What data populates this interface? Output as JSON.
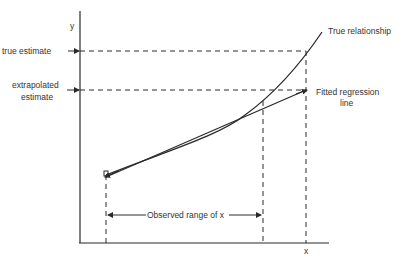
{
  "diagram": {
    "type": "regression-extrapolation",
    "labels": {
      "y_axis": "y",
      "x_axis": "x",
      "true_estimate": "true estimate",
      "extrapolated_line1": "extrapolated",
      "extrapolated_line2": "estimate",
      "true_relationship": "True relationship",
      "fitted_line1": "Fitted regression",
      "fitted_line2": "line",
      "observed_range": "Observed range of x"
    },
    "colors": {
      "ink": "#2a2a2a",
      "background": "#ffffff"
    }
  }
}
